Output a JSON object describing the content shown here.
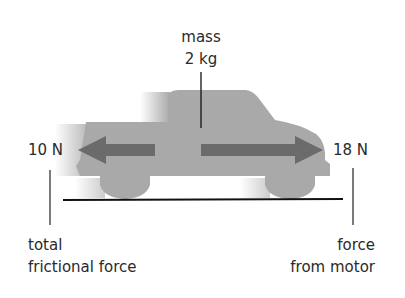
{
  "diagram": {
    "mass_label": "mass",
    "mass_value": "2 kg",
    "left_force": {
      "value": "10 N",
      "label_line1": "total",
      "label_line2": "frictional force",
      "direction": "left"
    },
    "right_force": {
      "value": "18 N",
      "label_line1": "force",
      "label_line2": "from motor",
      "direction": "right"
    },
    "object": "truck",
    "colors": {
      "truck_body": "#a9a9a9",
      "arrow": "#6b6b6b",
      "line": "#111111",
      "text": "#2a2a2a"
    }
  }
}
